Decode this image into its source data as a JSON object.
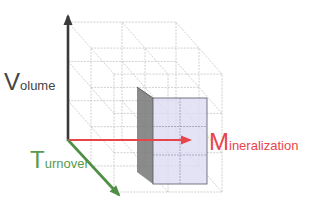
{
  "diagram": {
    "type": "3d-lattice-cube",
    "axes": {
      "vertical": {
        "initial": "V",
        "rest": "olume",
        "color": "#3a3a3a"
      },
      "horizontal": {
        "initial": "M",
        "rest": "ineralization",
        "color": "#e8454a"
      },
      "depth": {
        "initial": "T",
        "rest": "urnover",
        "color": "#4f8f45"
      }
    },
    "colors": {
      "grid": "#bdbdbd",
      "highlight_front": "#dcdcf2",
      "highlight_side": "#777777",
      "highlight_edge": "#555566"
    }
  }
}
